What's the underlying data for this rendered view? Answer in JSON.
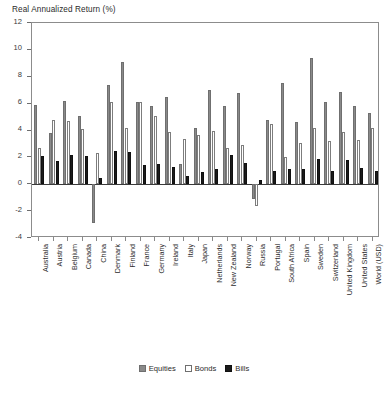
{
  "chart_data": {
    "type": "bar",
    "title": "Real Annualized Return (%)",
    "xlabel": "",
    "ylabel": "Real Annualized Return (%)",
    "ylim": [
      -4,
      12
    ],
    "yticks": [
      -4,
      -2,
      0,
      2,
      4,
      6,
      8,
      10,
      12
    ],
    "grid": false,
    "legend_position": "bottom-center",
    "categories": [
      "Australia",
      "Austria",
      "Belgium",
      "Canada",
      "China",
      "Denmark",
      "Finland",
      "France",
      "Germany",
      "Ireland",
      "Italy",
      "Japan",
      "Netherlands",
      "New Zealand",
      "Norway",
      "Russia",
      "Portugal",
      "South Africa",
      "Spain",
      "Sweden",
      "Switzerland",
      "United Kingdom",
      "United States",
      "World (USD)"
    ],
    "series": [
      {
        "name": "Equities",
        "color": "#8a8a8a",
        "values": [
          6.0,
          0.7,
          2.6,
          5.9,
          -3.0,
          5.2,
          5.3,
          3.2,
          3.2,
          4.1,
          1.9,
          4.1,
          5.0,
          6.0,
          4.3,
          -1.3,
          3.4,
          7.3,
          3.6,
          5.8,
          4.5,
          5.4,
          6.5,
          5.2
        ],
        "values_note": "approximate values read from bar heights"
      },
      {
        "name": "Bonds",
        "color": "#ffffff",
        "values": [
          1.4,
          -4.0,
          0.2,
          2.2,
          -3.8,
          3.2,
          0.2,
          0.0,
          -1.7,
          0.9,
          -1.6,
          -1.0,
          1.5,
          2.1,
          1.8,
          -3.6,
          0.6,
          1.8,
          1.4,
          2.6,
          2.3,
          1.3,
          2.0,
          1.8
        ],
        "values_note": "approximate values read from bar heights"
      },
      {
        "name": "Bills",
        "color": "#1b1b1b",
        "values": [
          0.7,
          -8.1,
          -0.3,
          1.5,
          -4.5,
          2.1,
          -0.5,
          -2.8,
          -2.4,
          0.7,
          -3.6,
          -1.9,
          0.6,
          1.7,
          1.1,
          -5.0,
          -1.1,
          1.0,
          0.3,
          1.8,
          0.8,
          1.0,
          0.9,
          0.9
        ],
        "values_note": "approximate values read from bar heights"
      }
    ],
    "plot_series": {
      "equities": [
        {
          "country": "Australia",
          "equities": 5.9,
          "bonds": 2.7,
          "bills": 2.1
        },
        {
          "country": "Austria",
          "equities": 3.8,
          "bonds": 4.8,
          "bills": 1.7
        },
        {
          "country": "Belgium",
          "equities": 6.2,
          "bonds": 4.7,
          "bills": 2.2
        },
        {
          "country": "Canada",
          "equities": 5.1,
          "bonds": 4.1,
          "bills": 2.1
        },
        {
          "country": "China",
          "equities": -2.9,
          "bonds": 2.3,
          "bills": 0.5
        },
        {
          "country": "Denmark",
          "equities": 7.4,
          "bonds": 6.1,
          "bills": 2.5
        },
        {
          "country": "Finland",
          "equities": 9.1,
          "bonds": 4.2,
          "bills": 2.4
        },
        {
          "country": "France",
          "equities": 6.1,
          "bonds": 6.1,
          "bills": 1.4
        },
        {
          "country": "Germany",
          "equities": 5.8,
          "bonds": 5.1,
          "bills": 1.5
        },
        {
          "country": "Ireland",
          "equities": 6.5,
          "bonds": 3.9,
          "bills": 1.3
        },
        {
          "country": "Italy",
          "equities": 1.5,
          "bonds": 3.4,
          "bills": 0.6
        },
        {
          "country": "Japan",
          "equities": 4.2,
          "bonds": 3.7,
          "bills": 0.9
        },
        {
          "country": "Netherlands",
          "equities": 7.0,
          "bonds": 4.0,
          "bills": 1.1
        },
        {
          "country": "New Zealand",
          "equities": 5.8,
          "bonds": 2.7,
          "bills": 2.2
        },
        {
          "country": "Norway",
          "equities": 6.8,
          "bonds": 2.9,
          "bills": 1.6
        },
        {
          "country": "Russia",
          "equities": -1.1,
          "bonds": -1.6,
          "bills": 0.3
        },
        {
          "country": "Portugal",
          "equities": 4.8,
          "bonds": 4.5,
          "bills": 1.0
        },
        {
          "country": "South Africa",
          "equities": 7.5,
          "bonds": 2.0,
          "bills": 1.1
        },
        {
          "country": "Spain",
          "equities": 4.6,
          "bonds": 3.1,
          "bills": 1.1
        },
        {
          "country": "Sweden",
          "equities": 9.4,
          "bonds": 4.2,
          "bills": 1.9
        },
        {
          "country": "Switzerland",
          "equities": 6.1,
          "bonds": 3.2,
          "bills": 1.0
        },
        {
          "country": "United Kingdom",
          "equities": 6.9,
          "bonds": 3.9,
          "bills": 1.8
        },
        {
          "country": "United States",
          "equities": 5.8,
          "bonds": 3.3,
          "bills": 1.2
        },
        {
          "country": "World (USD)",
          "equities": 5.3,
          "bonds": 4.2,
          "bills": 1.0
        }
      ]
    },
    "legend": [
      {
        "label": "Equities",
        "key": "equities",
        "color": "#8a8a8a"
      },
      {
        "label": "Bonds",
        "key": "bonds",
        "color": "#ffffff"
      },
      {
        "label": "Bills",
        "key": "bills",
        "color": "#1b1b1b"
      }
    ]
  }
}
